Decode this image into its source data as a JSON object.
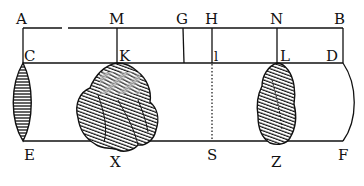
{
  "diagram": {
    "type": "geometric-figure-with-stones",
    "labels": {
      "A": "A",
      "M": "M",
      "G": "G",
      "H": "H",
      "N": "N",
      "B": "B",
      "C": "C",
      "K": "K",
      "I": "I",
      "L": "L",
      "D": "D",
      "E": "E",
      "X": "X",
      "S": "S",
      "Z": "Z",
      "F": "F"
    },
    "colors": {
      "ink": "#111111",
      "paper": "#ffffff"
    },
    "elements": [
      "top-line-AB",
      "middle-line-CD",
      "bottom-line-EF",
      "vertical-MK",
      "vertical-G",
      "vertical-HI",
      "vertical-NL",
      "dotted-line-IS",
      "lens-CE",
      "arc-DF",
      "stone-X",
      "stone-Z"
    ]
  }
}
